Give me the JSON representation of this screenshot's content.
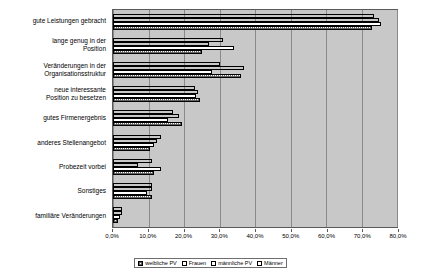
{
  "chart_data": {
    "type": "bar",
    "orientation": "horizontal",
    "title": "",
    "xlabel": "",
    "ylabel": "",
    "xlim": [
      0,
      80
    ],
    "grid": true,
    "legend_position": "bottom",
    "xticks": [
      "0,0%",
      "10,0%",
      "20,0%",
      "30,0%",
      "40,0%",
      "50,0%",
      "60,0%",
      "70,0%",
      "80,0%"
    ],
    "xtick_values": [
      0,
      10,
      20,
      30,
      40,
      50,
      60,
      70,
      80
    ],
    "categories": [
      "gute Leistungen gebracht",
      "lange genug in der\nPosition",
      "Veränderungen in der\nOrganisationsstruktur",
      "neue interessante\nPosition zu besetzen",
      "gutes Firmenergebnis",
      "anderes Stellenangebot",
      "Probezeit vorbei",
      "Sonstiges",
      "familiäre Veränderungen"
    ],
    "series": [
      {
        "name": "weibliche PV",
        "pattern": "light-hatch",
        "values": [
          73.0,
          25.0,
          36.0,
          24.5,
          19.5,
          10.5,
          11.5,
          11.0,
          1.5
        ]
      },
      {
        "name": "Frauen",
        "pattern": "white",
        "values": [
          75.5,
          34.0,
          28.0,
          23.5,
          15.5,
          11.5,
          13.5,
          9.5,
          2.0
        ]
      },
      {
        "name": "männliche PV",
        "pattern": "dark-hatch",
        "values": [
          75.0,
          27.0,
          37.0,
          24.0,
          18.5,
          12.5,
          7.0,
          11.0,
          2.5
        ]
      },
      {
        "name": "Männer",
        "pattern": "solid-black",
        "values": [
          73.5,
          31.0,
          30.0,
          23.0,
          17.0,
          13.5,
          11.0,
          11.0,
          2.5
        ]
      }
    ],
    "bar_order_top_to_bottom": [
      "Männer",
      "männliche PV",
      "Frauen",
      "weibliche PV"
    ],
    "colors": {
      "plot_background": "#c8c8c8",
      "gridline": "#8a8a8a",
      "axis_line": "#5a5a5a",
      "bar_outline": "#000000",
      "solid_black": "#000000",
      "white": "#ffffff"
    }
  },
  "legend": {
    "items": [
      {
        "label": "weibliche PV",
        "pattern": "light-hatch"
      },
      {
        "label": "Frauen",
        "pattern": "white"
      },
      {
        "label": "männliche PV",
        "pattern": "dark-hatch"
      },
      {
        "label": "Männer",
        "pattern": "solid-black"
      }
    ]
  }
}
